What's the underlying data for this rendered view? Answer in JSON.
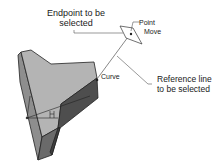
{
  "labels": {
    "endpoint": {
      "line1": "Endpoint to be",
      "line2": "selected"
    },
    "point": "Point",
    "move": "Move",
    "curve": "Curve",
    "reference": {
      "line1": "Reference line",
      "line2": "to be selected"
    },
    "h_marker": "H"
  },
  "colors": {
    "top_face": "#b4b4b4",
    "left_face": "#8e8e8e",
    "dark_face": "#4e4e4e",
    "bottom_face": "#6a6a6a",
    "edge": "#222222",
    "leader": "#555555"
  }
}
